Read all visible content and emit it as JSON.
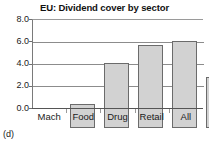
{
  "caption": "(d)",
  "chart_data": {
    "type": "bar",
    "title": "EU: Dividend cover by sector",
    "xlabel": "",
    "ylabel": "",
    "categories": [
      "Mach",
      "Food",
      "Drug",
      "Retail",
      "All"
    ],
    "values": [
      2.2,
      5.8,
      7.45,
      7.85,
      4.6
    ],
    "ylim": [
      0.0,
      8.0
    ],
    "ytick_labels": [
      "8.0",
      "6.0",
      "4.0",
      "2.0",
      "0.0"
    ],
    "ytick_values": [
      8.0,
      6.0,
      4.0,
      2.0,
      0.0
    ],
    "grid": "horizontal",
    "legend": "none",
    "bar_fill_color": "#d2d2d2",
    "bar_edge_color": "#6b6b6b",
    "background_color": "#ffffff"
  }
}
